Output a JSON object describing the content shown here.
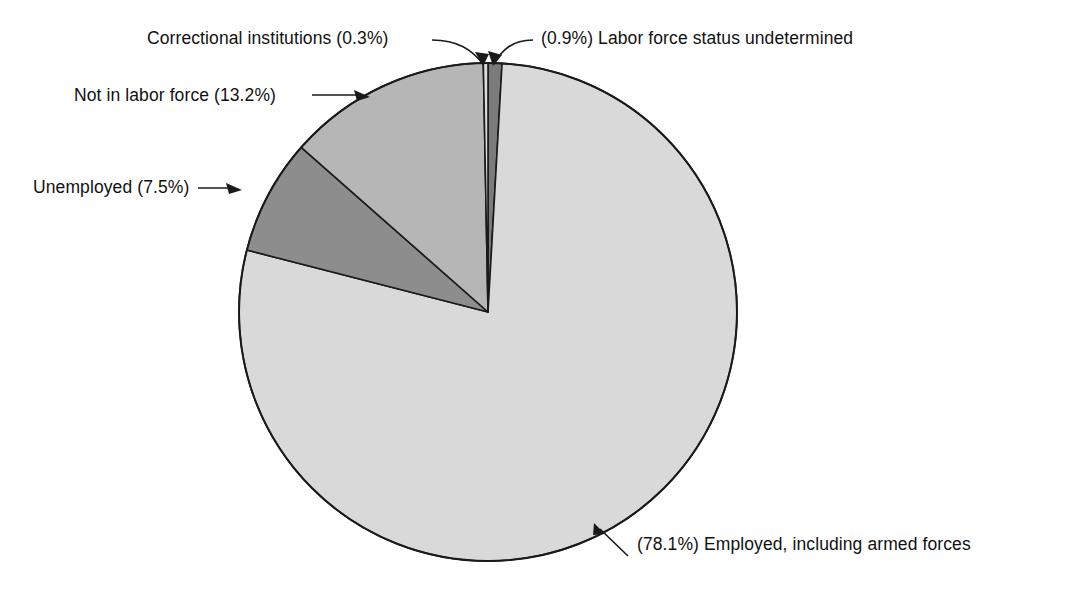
{
  "chart_data": {
    "type": "pie",
    "title": "",
    "subtitle": "",
    "xlabel": "",
    "ylabel": "",
    "legend_position": "none",
    "grid": false,
    "units": "percent",
    "total": 100.0,
    "start_angle_deg": 0,
    "direction": "clockwise",
    "categories": [
      "Labor force status undetermined",
      "Employed, including armed forces",
      "Unemployed",
      "Not in labor force",
      "Correctional institutions"
    ],
    "values": [
      0.9,
      78.1,
      7.5,
      13.2,
      0.3
    ],
    "slices": [
      {
        "name": "undetermined",
        "label": "(0.9%) Labor force status undetermined",
        "category": "Labor force status undetermined",
        "value": 0.9,
        "value_text": "(0.9%)",
        "color": "#7b7b7b",
        "start_deg": 0,
        "end_deg": 3.24
      },
      {
        "name": "employed",
        "label": "(78.1%) Employed, including armed forces",
        "category": "Employed, including armed forces",
        "value": 78.1,
        "value_text": "(78.1%)",
        "color": "#d9d9d9",
        "start_deg": 3.24,
        "end_deg": 284.4
      },
      {
        "name": "unemployed",
        "label": "Unemployed (7.5%)",
        "category": "Unemployed",
        "value": 7.5,
        "value_text": "(7.5%)",
        "color": "#8d8d8d",
        "start_deg": 284.4,
        "end_deg": 311.4
      },
      {
        "name": "not-in-labor-force",
        "label": "Not in labor force (13.2%)",
        "category": "Not in labor force",
        "value": 13.2,
        "value_text": "(13.2%)",
        "color": "#b6b6b6",
        "start_deg": 311.4,
        "end_deg": 358.92
      },
      {
        "name": "correctional",
        "label": "Correctional institutions (0.3%)",
        "category": "Correctional institutions",
        "value": 0.3,
        "value_text": "(0.3%)",
        "color": "#dcdcdc",
        "start_deg": 358.92,
        "end_deg": 360
      }
    ]
  },
  "labels": {
    "correctional": "Correctional institutions (0.3%)",
    "undetermined": "(0.9%) Labor force status undetermined",
    "not_in_labor_force": "Not in labor force (13.2%)",
    "unemployed": "Unemployed (7.5%)",
    "employed": "(78.1%) Employed, including armed forces"
  },
  "style": {
    "background": "#ffffff",
    "outline": "#1a1a1a",
    "text": "#111111"
  }
}
